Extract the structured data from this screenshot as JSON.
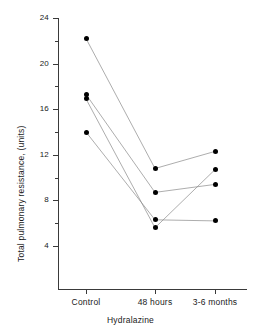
{
  "chart_data": {
    "type": "line",
    "title": "",
    "xlabel": "Hydralazine",
    "ylabel": "Total pulmonary resistance, (units)",
    "categories": [
      "Control",
      "48 hours",
      "3-6 months"
    ],
    "ylim": [
      2,
      24
    ],
    "yticks": [
      4,
      8,
      12,
      16,
      20,
      24
    ],
    "yminor": [
      6,
      10,
      14,
      18,
      22
    ],
    "grid": false,
    "legend": null,
    "marker": "filled-circle",
    "series": [
      {
        "name": "subject-1",
        "values": [
          22.2,
          10.8,
          12.3
        ]
      },
      {
        "name": "subject-2",
        "values": [
          17.3,
          8.7,
          9.4
        ]
      },
      {
        "name": "subject-3",
        "values": [
          16.9,
          5.6,
          10.7
        ]
      },
      {
        "name": "subject-4",
        "values": [
          14.0,
          6.3,
          6.2
        ]
      }
    ]
  },
  "axis": {
    "ytick_labels": [
      "24",
      "20",
      "16",
      "12",
      "8",
      "4"
    ],
    "xtick_labels": [
      "Control",
      "48 hours",
      "3-6 months"
    ],
    "ylabel_text": "Total pulmonary resistance, (units)",
    "xlabel_text": "Hydralazine"
  },
  "colors": {
    "axis": "#3a3a3a",
    "marker": "#000000",
    "line": "#8a8a8a",
    "background": "#ffffff"
  }
}
